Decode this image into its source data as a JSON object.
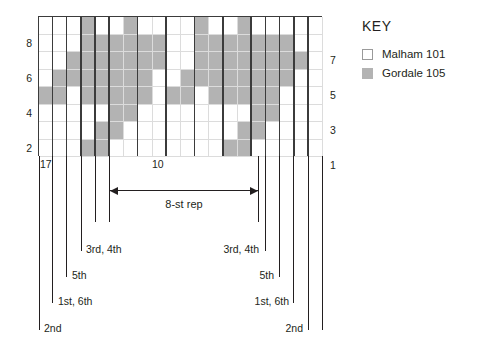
{
  "chart_data": {
    "type": "heatmap",
    "title": "",
    "xlabel": "",
    "ylabel": "",
    "rows": 8,
    "columns": 20,
    "row_labels_left": [
      "8",
      "",
      "6",
      "",
      "4",
      "",
      "2",
      ""
    ],
    "row_labels_right": [
      "",
      "7",
      "",
      "5",
      "",
      "3",
      "",
      "1"
    ],
    "legend": [
      {
        "key": "m",
        "label": "Malham 101",
        "color": "#ffffff"
      },
      {
        "key": "g",
        "label": "Gordale 105",
        "color": "#b3b3b3"
      }
    ],
    "legend_position": "right",
    "grid": true,
    "cell_codes": [
      "mmmgmmgmmmmgmmgmmmmm",
      "mmmggggggmmggggggmmm",
      "mmgggggggmmggggggggm",
      "mggggggg mmgggggggmm",
      "ggmgggggmggmgggggmmm",
      "mmmmmggmmmmmmmmggmmm",
      "mmmmggmmmmmmmmggmmmm",
      "mmmggmmmmmmmmggmmmmm"
    ],
    "rows_top_to_bottom": [
      {
        "row": 8,
        "cells": [
          "m",
          "m",
          "m",
          "g",
          "m",
          "m",
          "g",
          "m",
          "m",
          "m",
          "m",
          "g",
          "m",
          "m",
          "g",
          "m",
          "m",
          "m",
          "m",
          "m"
        ]
      },
      {
        "row": 7,
        "cells": [
          "m",
          "m",
          "m",
          "g",
          "g",
          "g",
          "g",
          "g",
          "g",
          "m",
          "m",
          "g",
          "g",
          "g",
          "g",
          "g",
          "g",
          "g",
          "m",
          "m"
        ]
      },
      {
        "row": 6,
        "cells": [
          "m",
          "m",
          "g",
          "g",
          "g",
          "g",
          "g",
          "g",
          "g",
          "m",
          "m",
          "g",
          "g",
          "g",
          "g",
          "g",
          "g",
          "g",
          "g",
          "m"
        ]
      },
      {
        "row": 5,
        "cells": [
          "m",
          "g",
          "g",
          "g",
          "g",
          "g",
          "g",
          "g",
          "m",
          "m",
          "g",
          "g",
          "g",
          "g",
          "g",
          "g",
          "g",
          "g",
          "m",
          "m"
        ]
      },
      {
        "row": 4,
        "cells": [
          "g",
          "g",
          "m",
          "g",
          "g",
          "g",
          "g",
          "g",
          "m",
          "g",
          "g",
          "m",
          "g",
          "g",
          "g",
          "g",
          "g",
          "m",
          "m",
          "m"
        ]
      },
      {
        "row": 3,
        "cells": [
          "m",
          "m",
          "m",
          "m",
          "m",
          "g",
          "g",
          "m",
          "m",
          "m",
          "m",
          "m",
          "m",
          "m",
          "m",
          "g",
          "g",
          "m",
          "m",
          "m"
        ]
      },
      {
        "row": 2,
        "cells": [
          "m",
          "m",
          "m",
          "m",
          "g",
          "g",
          "m",
          "m",
          "m",
          "m",
          "m",
          "m",
          "m",
          "m",
          "g",
          "g",
          "m",
          "m",
          "m",
          "m"
        ]
      },
      {
        "row": 1,
        "cells": [
          "m",
          "m",
          "m",
          "g",
          "g",
          "m",
          "m",
          "m",
          "m",
          "m",
          "m",
          "m",
          "m",
          "g",
          "g",
          "m",
          "m",
          "m",
          "m",
          "m"
        ]
      }
    ],
    "stitch_count_labels": [
      {
        "text": "17",
        "note": "left edge stitch number"
      },
      {
        "text": "10",
        "note": "centre stitch number"
      }
    ],
    "repeat": {
      "label": "8-st rep",
      "stitches": 8
    },
    "size_annotations_left": [
      {
        "text": "3rd, 4th"
      },
      {
        "text": "5th"
      },
      {
        "text": "1st, 6th"
      },
      {
        "text": "2nd"
      }
    ],
    "size_annotations_right": [
      {
        "text": "3rd, 4th"
      },
      {
        "text": "5th"
      },
      {
        "text": "1st, 6th"
      },
      {
        "text": "2nd"
      }
    ]
  },
  "key": {
    "title": "KEY",
    "items": [
      {
        "swatch": "m",
        "label": "Malham 101"
      },
      {
        "swatch": "g",
        "label": "Gordale 105"
      }
    ]
  },
  "labels": {
    "left_stitch_count": "17",
    "center_stitch_count": "10",
    "repeat_label": "8-st rep",
    "left_3rd4th": "3rd, 4th",
    "left_5th": "5th",
    "left_1st6th": "1st, 6th",
    "left_2nd": "2nd",
    "right_3rd4th": "3rd, 4th",
    "right_5th": "5th",
    "right_1st6th": "1st, 6th",
    "right_2nd": "2nd"
  },
  "row_numbers": {
    "left": [
      {
        "value": "8",
        "row": 8
      },
      {
        "value": "6",
        "row": 6
      },
      {
        "value": "4",
        "row": 4
      },
      {
        "value": "2",
        "row": 2
      }
    ],
    "right": [
      {
        "value": "7",
        "row": 7
      },
      {
        "value": "5",
        "row": 5
      },
      {
        "value": "3",
        "row": 3
      },
      {
        "value": "1",
        "row": 1
      }
    ]
  },
  "colors": {
    "malham": "#ffffff",
    "gordale": "#b3b3b3",
    "grid_line": "#3b3b3b",
    "light_line": "#dcdcdc",
    "text": "#231f20"
  }
}
